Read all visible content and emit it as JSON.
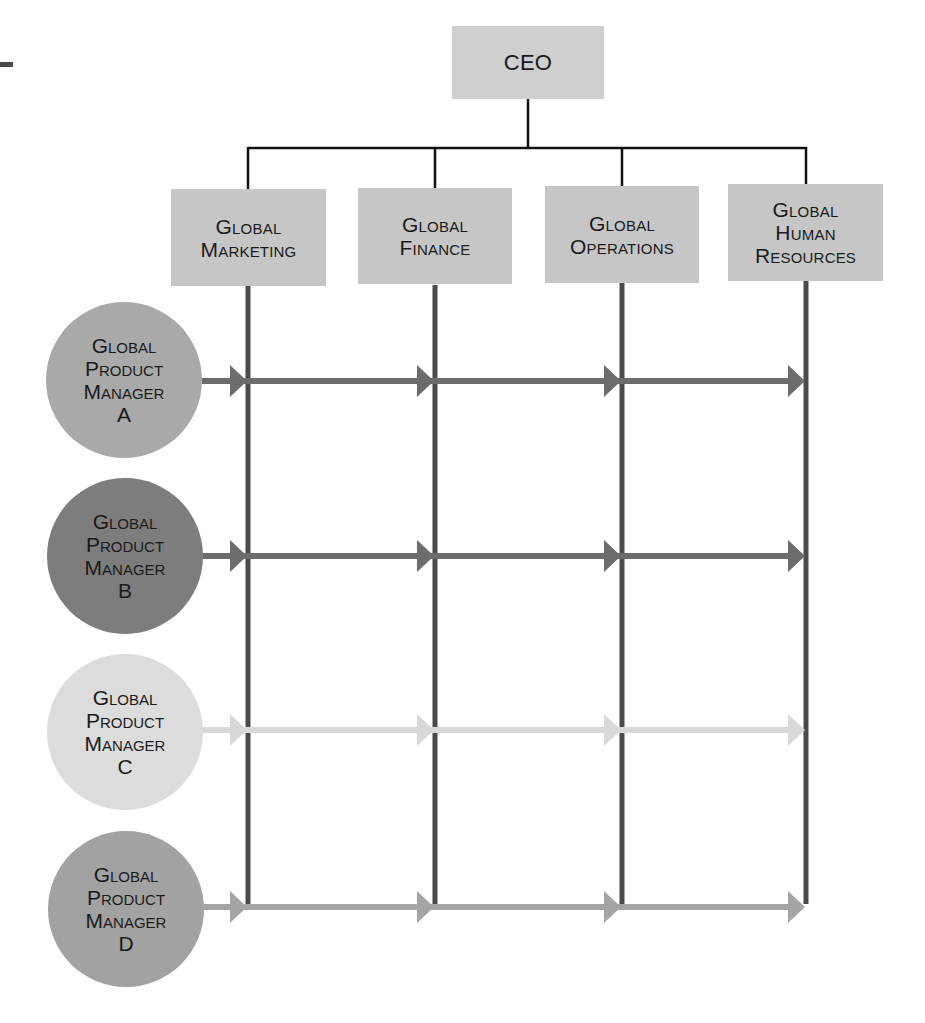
{
  "diagram": {
    "type": "matrix-organization-chart",
    "ceo": {
      "label": "CEO",
      "color": "#cfcfcf"
    },
    "functions": [
      {
        "label": "Global\nMarketing",
        "color": "#c6c6c6"
      },
      {
        "label": "Global\nFinance",
        "color": "#c6c6c6"
      },
      {
        "label": "Global\nOperations",
        "color": "#c6c6c6"
      },
      {
        "label": "Global\nHuman\nResources",
        "color": "#c6c6c6"
      }
    ],
    "product_managers": [
      {
        "label": "Global\nProduct\nManager\nA",
        "color": "#a9a9a9",
        "arrow_color": "#6c6c6c"
      },
      {
        "label": "Global\nProduct\nManager\nB",
        "color": "#7d7d7d",
        "arrow_color": "#6c6c6c"
      },
      {
        "label": "Global\nProduct\nManager\nC",
        "color": "#dcdcdc",
        "arrow_color": "#d8d8d8"
      },
      {
        "label": "Global\nProduct\nManager\nD",
        "color": "#a2a2a2",
        "arrow_color": "#a4a4a4"
      }
    ],
    "colors": {
      "hierarchy_line": "#111111",
      "function_line": "#4a4a4a"
    }
  }
}
